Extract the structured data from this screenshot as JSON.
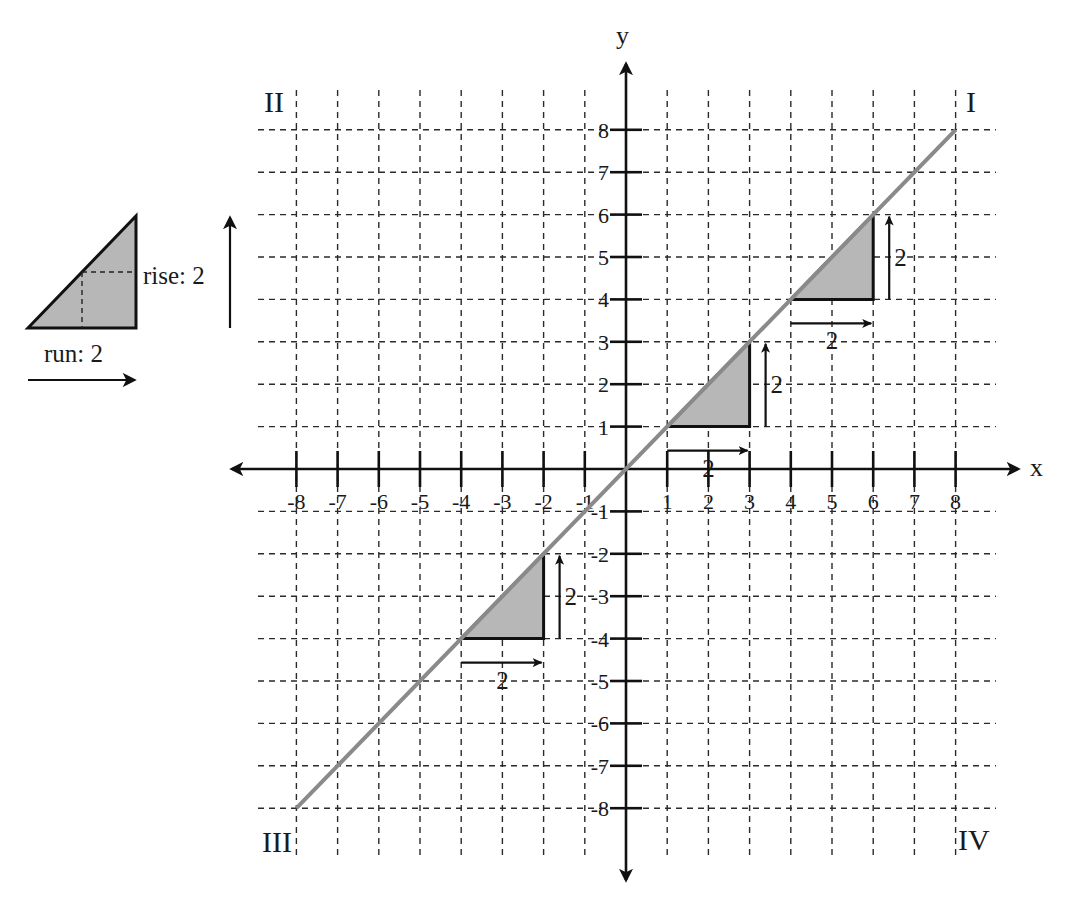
{
  "diagram": {
    "axes": {
      "x_label": "x",
      "y_label": "y",
      "x_range": [
        -8,
        8
      ],
      "y_range": [
        -8,
        8
      ],
      "x_ticks": [
        -8,
        -7,
        -6,
        -5,
        -4,
        -3,
        -2,
        -1,
        1,
        2,
        3,
        4,
        5,
        6,
        7,
        8
      ],
      "y_ticks": [
        -8,
        -7,
        -6,
        -5,
        -4,
        -3,
        -2,
        -1,
        1,
        2,
        3,
        4,
        5,
        6,
        7,
        8
      ],
      "grid": "dashed"
    },
    "quadrants": {
      "I": "I",
      "II": "II",
      "III": "III",
      "IV": "IV"
    },
    "line": {
      "equation": "y = x",
      "slope": 1,
      "from": [
        -8,
        -8
      ],
      "to": [
        8,
        8
      ],
      "color": "#8a8a8a"
    },
    "triangles": [
      {
        "start": [
          -4,
          -4
        ],
        "run": 2,
        "rise": 2,
        "run_label": "2",
        "rise_label": "2"
      },
      {
        "start": [
          1,
          1
        ],
        "run": 2,
        "rise": 2,
        "run_label": "2",
        "rise_label": "2"
      },
      {
        "start": [
          4,
          4
        ],
        "run": 2,
        "rise": 2,
        "run_label": "2",
        "rise_label": "2"
      }
    ],
    "legend": {
      "rise_label": "rise: 2",
      "run_label": "run: 2"
    },
    "colors": {
      "triangle_fill": "#b7b7b7",
      "ink": "#111111"
    }
  }
}
